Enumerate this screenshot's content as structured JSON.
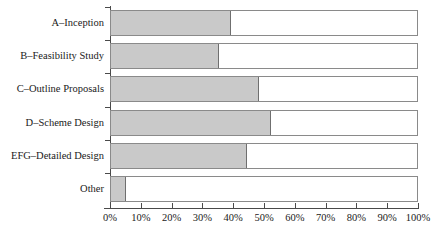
{
  "chart_data": {
    "type": "bar",
    "orientation": "horizontal",
    "stacked": true,
    "title": "",
    "xlabel": "",
    "ylabel": "",
    "xlim": [
      0,
      100
    ],
    "ylim": null,
    "grid": false,
    "legend": null,
    "categories": [
      "A–Inception",
      "B–Feasibility Study",
      "C–Outline Proposals",
      "D–Scheme Design",
      "EFG–Detailed Design",
      "Other"
    ],
    "values": [
      39,
      35,
      48,
      52,
      44,
      5
    ],
    "remainder_values": [
      61,
      65,
      52,
      48,
      56,
      95
    ],
    "series": [
      {
        "name": "filled",
        "color": "#c9c9c9",
        "values": [
          39,
          35,
          48,
          52,
          44,
          5
        ]
      },
      {
        "name": "remainder",
        "color": "#ffffff",
        "values": [
          61,
          65,
          52,
          48,
          56,
          95
        ]
      }
    ],
    "xticks": [
      0,
      10,
      20,
      30,
      40,
      50,
      60,
      70,
      80,
      90,
      100
    ],
    "xticklabels": [
      "0%",
      "10%",
      "20%",
      "30%",
      "40%",
      "50%",
      "60%",
      "70%",
      "80%",
      "90%",
      "100%"
    ]
  },
  "style": {
    "fill_color": "#c9c9c9",
    "empty_color": "#ffffff",
    "bar_border_color": "#8a8a8a",
    "axis_color": "#4a4a4a",
    "text_color": "#1a1a1a",
    "background": "#ffffff"
  }
}
